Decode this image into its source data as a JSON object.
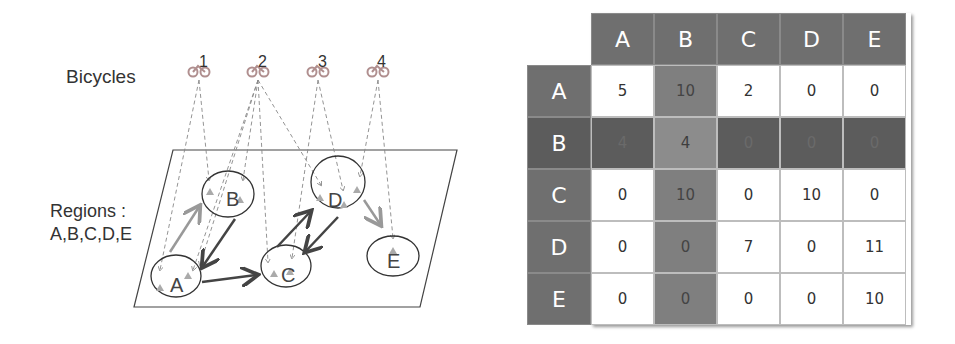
{
  "diagram": {
    "bicycles_label": "Bicycles",
    "bicycles": [
      {
        "id": "1",
        "icon": "bicycle-icon"
      },
      {
        "id": "2",
        "icon": "bicycle-icon"
      },
      {
        "id": "3",
        "icon": "bicycle-icon"
      },
      {
        "id": "4",
        "icon": "bicycle-icon"
      }
    ],
    "regions_label_line1": "Regions :",
    "regions_label_line2": "A,B,C,D,E",
    "regions": [
      "A",
      "B",
      "C",
      "D",
      "E"
    ],
    "transitions": [
      {
        "from": "A",
        "to": "B"
      },
      {
        "from": "B",
        "to": "A"
      },
      {
        "from": "A",
        "to": "C"
      },
      {
        "from": "C",
        "to": "D"
      },
      {
        "from": "D",
        "to": "C"
      },
      {
        "from": "D",
        "to": "E"
      }
    ]
  },
  "matrix": {
    "columns": [
      "A",
      "B",
      "C",
      "D",
      "E"
    ],
    "rows": [
      {
        "label": "A",
        "values": [
          "5",
          "10",
          "2",
          "0",
          "0"
        ]
      },
      {
        "label": "B",
        "values": [
          "4",
          "4",
          "0",
          "0",
          "0"
        ]
      },
      {
        "label": "C",
        "values": [
          "0",
          "10",
          "0",
          "10",
          "0"
        ]
      },
      {
        "label": "D",
        "values": [
          "0",
          "0",
          "7",
          "0",
          "11"
        ]
      },
      {
        "label": "E",
        "values": [
          "0",
          "0",
          "0",
          "0",
          "10"
        ]
      }
    ],
    "highlight": {
      "row": "B",
      "column": "B"
    },
    "colors": {
      "header": "#6f6f6f",
      "highlight_column": "#7f7f7f",
      "highlight_row": "#5c5c5c",
      "cell": "#ffffff"
    }
  }
}
